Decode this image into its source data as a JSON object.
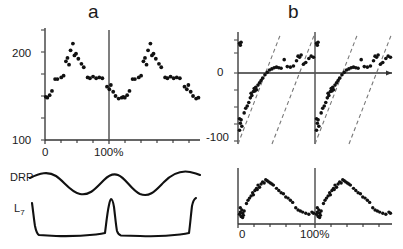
{
  "figure": {
    "background": "#ffffff",
    "ink_color": "#1a1a1a",
    "width": 403,
    "height": 249
  },
  "panels": {
    "a": {
      "letter": "a",
      "yaxis": {
        "top_label": "200",
        "bottom_label": "100"
      },
      "xaxis": {
        "start_label": "0",
        "cycle_label": "100%"
      },
      "traces": [
        {
          "label_main": "DRP",
          "label_sub": ""
        },
        {
          "label_main": "L",
          "label_sub": "7"
        }
      ]
    },
    "b": {
      "letter": "b",
      "upper_yaxis": {
        "zero_label": "0",
        "min_label": "-100"
      },
      "lower_xaxis": {
        "start_label": "0",
        "cycle_label": "100%"
      }
    }
  },
  "chart_data": [
    {
      "id": "panel-a-scatter",
      "type": "scatter",
      "title": "a",
      "xlabel": "",
      "ylabel": "",
      "xlim": [
        0,
        200
      ],
      "ylim": [
        100,
        230
      ],
      "xtick_labels": [
        "0",
        "100%"
      ],
      "xtick_values": [
        0,
        100
      ],
      "ytick_labels": [
        "100",
        "200"
      ],
      "ytick_values": [
        100,
        200
      ],
      "grid": false,
      "legend": false,
      "marker": "filled-circle",
      "cycle_markers": [
        0,
        100
      ],
      "points": [
        [
          1,
          151
        ],
        [
          3,
          150
        ],
        [
          6,
          153
        ],
        [
          9,
          158
        ],
        [
          13,
          172
        ],
        [
          16,
          172
        ],
        [
          21,
          174
        ],
        [
          24,
          176
        ],
        [
          27,
          193
        ],
        [
          29,
          197
        ],
        [
          31,
          189
        ],
        [
          33,
          206
        ],
        [
          36,
          214
        ],
        [
          38,
          200
        ],
        [
          40,
          202
        ],
        [
          43,
          196
        ],
        [
          47,
          190
        ],
        [
          50,
          186
        ],
        [
          55,
          174
        ],
        [
          58,
          173
        ],
        [
          62,
          175
        ],
        [
          66,
          173
        ],
        [
          70,
          174
        ],
        [
          74,
          173
        ],
        [
          80,
          163
        ],
        [
          83,
          160
        ],
        [
          85,
          165
        ],
        [
          88,
          157
        ],
        [
          91,
          152
        ],
        [
          95,
          149
        ],
        [
          99,
          150
        ],
        [
          101,
          151
        ],
        [
          103,
          150
        ],
        [
          106,
          153
        ],
        [
          109,
          158
        ],
        [
          113,
          172
        ],
        [
          116,
          172
        ],
        [
          121,
          174
        ],
        [
          124,
          176
        ],
        [
          127,
          193
        ],
        [
          129,
          197
        ],
        [
          131,
          189
        ],
        [
          133,
          206
        ],
        [
          136,
          214
        ],
        [
          138,
          200
        ],
        [
          140,
          202
        ],
        [
          143,
          196
        ],
        [
          147,
          190
        ],
        [
          150,
          186
        ],
        [
          155,
          174
        ],
        [
          158,
          173
        ],
        [
          162,
          175
        ],
        [
          166,
          173
        ],
        [
          170,
          174
        ],
        [
          174,
          173
        ],
        [
          180,
          163
        ],
        [
          183,
          160
        ],
        [
          185,
          165
        ],
        [
          188,
          157
        ],
        [
          191,
          152
        ],
        [
          195,
          149
        ],
        [
          198,
          150
        ]
      ]
    },
    {
      "id": "panel-a-drp-trace",
      "type": "line",
      "title": "DRP",
      "description": "smooth sinusoidal cord dorsum potential waveform, two cycles",
      "xlim": [
        0,
        200
      ],
      "ylim": [
        -1,
        1
      ],
      "grid": false
    },
    {
      "id": "panel-a-l7-trace",
      "type": "line",
      "title": "L7",
      "description": "flat baseline with sharp narrow spikes at cycle boundaries, two cycles",
      "xlim": [
        0,
        200
      ],
      "ylim": [
        -1,
        1
      ],
      "grid": false
    },
    {
      "id": "panel-b-upper-scatter",
      "type": "scatter",
      "title": "b",
      "xlabel": "",
      "ylabel": "",
      "xlim": [
        0,
        200
      ],
      "ylim": [
        -130,
        60
      ],
      "ytick_labels": [
        "0",
        "-100"
      ],
      "ytick_values": [
        0,
        -100
      ],
      "grid": false,
      "legend": false,
      "marker": "filled-circle",
      "reference_lines": [
        {
          "style": "dashed",
          "description": "diagonal rising line, cycle 1"
        },
        {
          "style": "dashed",
          "description": "diagonal rising line, cycle 2"
        }
      ],
      "cycle_markers": [
        0,
        100
      ],
      "points": [
        [
          2,
          42
        ],
        [
          4,
          44
        ],
        [
          3,
          39
        ],
        [
          2,
          -88
        ],
        [
          4,
          -90
        ],
        [
          3,
          -96
        ],
        [
          5,
          -101
        ],
        [
          2,
          -108
        ],
        [
          8,
          -78
        ],
        [
          10,
          -70
        ],
        [
          12,
          -66
        ],
        [
          14,
          -60
        ],
        [
          16,
          -52
        ],
        [
          18,
          -48
        ],
        [
          17,
          -44
        ],
        [
          20,
          -41
        ],
        [
          22,
          -40
        ],
        [
          24,
          -38
        ],
        [
          21,
          -36
        ],
        [
          23,
          -34
        ],
        [
          26,
          -30
        ],
        [
          28,
          -26
        ],
        [
          30,
          -22
        ],
        [
          32,
          -18
        ],
        [
          35,
          -12
        ],
        [
          38,
          -8
        ],
        [
          41,
          -4
        ],
        [
          44,
          -2
        ],
        [
          47,
          0
        ],
        [
          50,
          1
        ],
        [
          53,
          0
        ],
        [
          56,
          -1
        ],
        [
          60,
          14
        ],
        [
          64,
          2
        ],
        [
          68,
          1
        ],
        [
          72,
          3
        ],
        [
          76,
          12
        ],
        [
          78,
          20
        ],
        [
          80,
          18
        ],
        [
          82,
          22
        ],
        [
          85,
          6
        ],
        [
          88,
          9
        ],
        [
          92,
          16
        ],
        [
          95,
          20
        ],
        [
          98,
          18
        ],
        [
          102,
          42
        ],
        [
          104,
          44
        ],
        [
          103,
          39
        ],
        [
          102,
          -88
        ],
        [
          104,
          -90
        ],
        [
          103,
          -96
        ],
        [
          105,
          -101
        ],
        [
          102,
          -108
        ],
        [
          108,
          -78
        ],
        [
          110,
          -70
        ],
        [
          112,
          -66
        ],
        [
          114,
          -60
        ],
        [
          116,
          -52
        ],
        [
          118,
          -48
        ],
        [
          117,
          -44
        ],
        [
          120,
          -41
        ],
        [
          122,
          -40
        ],
        [
          124,
          -38
        ],
        [
          121,
          -36
        ],
        [
          123,
          -34
        ],
        [
          126,
          -30
        ],
        [
          128,
          -26
        ],
        [
          130,
          -22
        ],
        [
          132,
          -18
        ],
        [
          135,
          -12
        ],
        [
          138,
          -8
        ],
        [
          141,
          -4
        ],
        [
          144,
          -2
        ],
        [
          147,
          0
        ],
        [
          150,
          1
        ],
        [
          153,
          0
        ],
        [
          156,
          -1
        ],
        [
          160,
          14
        ],
        [
          164,
          2
        ],
        [
          168,
          1
        ],
        [
          172,
          3
        ],
        [
          176,
          12
        ],
        [
          178,
          20
        ],
        [
          180,
          18
        ],
        [
          182,
          22
        ],
        [
          185,
          6
        ],
        [
          188,
          9
        ],
        [
          192,
          16
        ],
        [
          195,
          20
        ],
        [
          198,
          18
        ]
      ]
    },
    {
      "id": "panel-b-lower-scatter",
      "type": "scatter",
      "title": "",
      "xlabel": "",
      "ylabel": "",
      "xlim": [
        0,
        200
      ],
      "ylim": [
        0,
        100
      ],
      "xtick_labels": [
        "0",
        "100%"
      ],
      "xtick_values": [
        0,
        100
      ],
      "grid": false,
      "legend": false,
      "marker": "filled-circle",
      "cycle_markers": [
        0,
        100
      ],
      "points": [
        [
          2,
          18
        ],
        [
          3,
          22
        ],
        [
          4,
          14
        ],
        [
          5,
          26
        ],
        [
          3,
          30
        ],
        [
          6,
          20
        ],
        [
          7,
          16
        ],
        [
          8,
          24
        ],
        [
          6,
          12
        ],
        [
          11,
          38
        ],
        [
          13,
          44
        ],
        [
          15,
          48
        ],
        [
          17,
          52
        ],
        [
          19,
          58
        ],
        [
          20,
          54
        ],
        [
          22,
          62
        ],
        [
          24,
          66
        ],
        [
          26,
          72
        ],
        [
          25,
          64
        ],
        [
          28,
          68
        ],
        [
          30,
          74
        ],
        [
          32,
          78
        ],
        [
          34,
          76
        ],
        [
          36,
          82
        ],
        [
          38,
          80
        ],
        [
          40,
          78
        ],
        [
          42,
          76
        ],
        [
          44,
          74
        ],
        [
          46,
          72
        ],
        [
          50,
          66
        ],
        [
          53,
          62
        ],
        [
          56,
          58
        ],
        [
          59,
          56
        ],
        [
          62,
          50
        ],
        [
          65,
          48
        ],
        [
          68,
          44
        ],
        [
          71,
          40
        ],
        [
          75,
          30
        ],
        [
          78,
          26
        ],
        [
          81,
          24
        ],
        [
          84,
          22
        ],
        [
          88,
          20
        ],
        [
          92,
          18
        ],
        [
          96,
          22
        ],
        [
          98,
          20
        ],
        [
          102,
          18
        ],
        [
          103,
          22
        ],
        [
          104,
          14
        ],
        [
          105,
          26
        ],
        [
          103,
          30
        ],
        [
          106,
          20
        ],
        [
          107,
          16
        ],
        [
          108,
          24
        ],
        [
          106,
          12
        ],
        [
          111,
          38
        ],
        [
          113,
          44
        ],
        [
          115,
          48
        ],
        [
          117,
          52
        ],
        [
          119,
          58
        ],
        [
          120,
          54
        ],
        [
          122,
          62
        ],
        [
          124,
          66
        ],
        [
          126,
          72
        ],
        [
          125,
          64
        ],
        [
          128,
          68
        ],
        [
          130,
          74
        ],
        [
          132,
          78
        ],
        [
          134,
          76
        ],
        [
          136,
          82
        ],
        [
          138,
          80
        ],
        [
          140,
          78
        ],
        [
          142,
          76
        ],
        [
          144,
          74
        ],
        [
          146,
          72
        ],
        [
          150,
          66
        ],
        [
          153,
          62
        ],
        [
          156,
          58
        ],
        [
          159,
          56
        ],
        [
          162,
          50
        ],
        [
          165,
          48
        ],
        [
          168,
          44
        ],
        [
          171,
          40
        ],
        [
          175,
          30
        ],
        [
          178,
          26
        ],
        [
          181,
          24
        ],
        [
          184,
          22
        ],
        [
          188,
          20
        ],
        [
          192,
          18
        ],
        [
          196,
          22
        ],
        [
          198,
          20
        ]
      ]
    }
  ]
}
